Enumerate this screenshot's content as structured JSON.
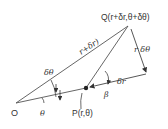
{
  "diagram": {
    "colors": {
      "line": "#555555",
      "axis_start": "#6b7fa8",
      "axis_end": "#e8d870",
      "text": "#333333"
    },
    "labels": {
      "origin": "O",
      "point_p": "P(r,θ)",
      "point_q": "Q(r+δr,θ+δθ)",
      "segment_oq": "r+δr)",
      "r_dtheta": "r δθ",
      "dr": "δr",
      "dtheta": "δθ",
      "theta": "θ",
      "beta": "β"
    }
  }
}
